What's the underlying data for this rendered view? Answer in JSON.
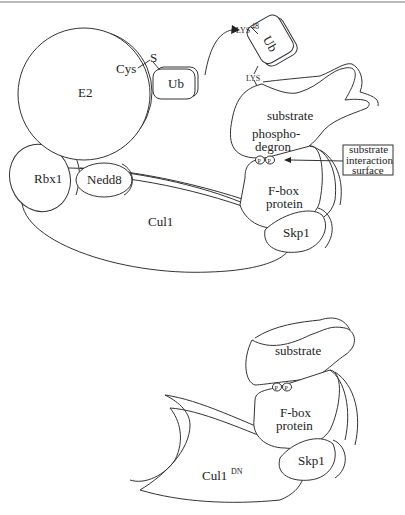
{
  "top_panel": {
    "e2": "E2",
    "cys": "Cys",
    "s": "S",
    "ub_attached": "Ub",
    "ub_transferred": "Ub",
    "lys48": "LYS",
    "lys48_sup": "48",
    "lys": "LYS",
    "substrate": "substrate",
    "phosphodegron_1": "phospho-",
    "phosphodegron_2": "degron",
    "p1": "P",
    "p2": "P",
    "callout": [
      "substrate",
      "interaction",
      "surface"
    ],
    "fbox_1": "F-box",
    "fbox_2": "protein",
    "rbx1": "Rbx1",
    "nedd8": "Nedd8",
    "cul1": "Cul1",
    "skp1": "Skp1"
  },
  "bottom_panel": {
    "substrate": "substrate",
    "p1": "P",
    "p2": "P",
    "fbox_1": "F-box",
    "fbox_2": "protein",
    "cul1dn": "Cul1",
    "cul1dn_sup": "DN",
    "skp1": "Skp1"
  },
  "colors": {
    "line": "#333333",
    "background": "#ffffff"
  }
}
